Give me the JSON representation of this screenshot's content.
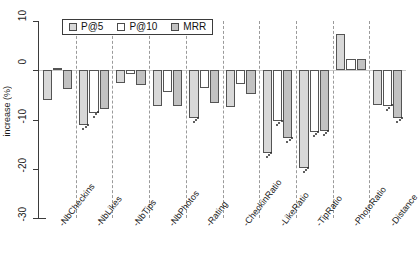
{
  "chart_data": {
    "type": "bar",
    "title": "",
    "subtitle": "",
    "xlabel": "",
    "ylabel": "increase (%)",
    "ylim": [
      -30,
      10
    ],
    "yticks": [
      10,
      0,
      -10,
      -20,
      -30
    ],
    "ytick_labels": [
      "10",
      "0",
      "-10",
      "-20",
      "-30"
    ],
    "grid": false,
    "group_separators": true,
    "legend_position": "top-left",
    "categories": [
      "-NbCheckins",
      "-NbLikes",
      "-NbTips",
      "-NbPhotos",
      "-Rating",
      "-CheckinRatio",
      "-LikeRatio",
      "-TipRatio",
      "-PhotoRatio",
      "-Distance"
    ],
    "series": [
      {
        "name": "P@5",
        "color": "#d8d8d8",
        "values": [
          -6.0,
          -11.1,
          -2.6,
          -7.3,
          -9.7,
          -7.4,
          -16.8,
          -19.9,
          7.3,
          -7.0
        ],
        "significant": [
          false,
          true,
          false,
          false,
          true,
          false,
          true,
          true,
          false,
          false
        ]
      },
      {
        "name": "P@10",
        "color": "#ffffff",
        "values": [
          0.5,
          -8.6,
          -0.7,
          -4.4,
          -3.6,
          -2.7,
          -10.4,
          -12.6,
          2.2,
          -7.2
        ],
        "significant": [
          false,
          true,
          false,
          false,
          false,
          false,
          true,
          true,
          false,
          true
        ]
      },
      {
        "name": "MRR",
        "color": "#c2c2c2",
        "values": [
          -3.8,
          -7.9,
          -2.9,
          -7.2,
          -6.7,
          -4.8,
          -13.8,
          -12.4,
          2.3,
          -9.7
        ],
        "significant": [
          false,
          false,
          false,
          false,
          false,
          false,
          true,
          true,
          false,
          true
        ]
      }
    ],
    "legend_entries": [
      "P@5",
      "P@10",
      "MRR"
    ],
    "annotation_note": "dots below bars mark statistically significant changes"
  },
  "axis": {
    "y_title": "increase (%)"
  }
}
